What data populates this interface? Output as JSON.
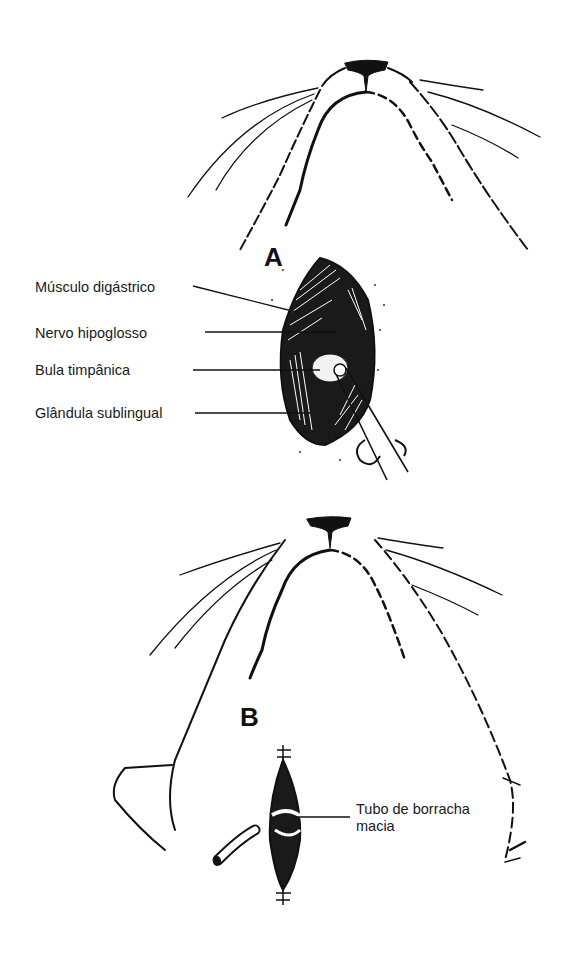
{
  "figure": {
    "panels": [
      {
        "id": "A",
        "letter": "A",
        "labels": [
          {
            "text": "Músculo digástrico"
          },
          {
            "text": "Nervo hipoglosso"
          },
          {
            "text": "Bula timpânica"
          },
          {
            "text": "Glândula sublingual"
          }
        ]
      },
      {
        "id": "B",
        "letter": "B",
        "labels": [
          {
            "text": "Tubo de borracha",
            "text2": "macia"
          }
        ]
      }
    ]
  }
}
